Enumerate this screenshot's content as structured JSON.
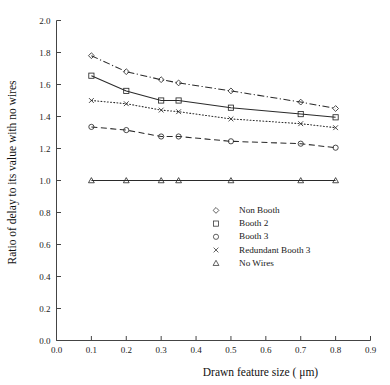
{
  "chart_data": {
    "type": "line",
    "title": "",
    "xlabel": "Drawn feature size ( μm)",
    "ylabel": "Ratio of delay to its value with no wires",
    "xlim": [
      0.0,
      0.9
    ],
    "ylim": [
      0.0,
      2.0
    ],
    "xticks": [
      "0.0",
      "0.1",
      "0.2",
      "0.3",
      "0.4",
      "0.5",
      "0.6",
      "0.7",
      "0.8",
      "0.9"
    ],
    "xtick_values": [
      0.0,
      0.1,
      0.2,
      0.3,
      0.4,
      0.5,
      0.6,
      0.7,
      0.8,
      0.9
    ],
    "yticks": [
      "0.0",
      "0.2",
      "0.4",
      "0.6",
      "0.8",
      "1.0",
      "1.2",
      "1.4",
      "1.6",
      "1.8",
      "2.0"
    ],
    "ytick_values": [
      0.0,
      0.2,
      0.4,
      0.6,
      0.8,
      1.0,
      1.2,
      1.4,
      1.6,
      1.8,
      2.0
    ],
    "grid": false,
    "legend_position": "center",
    "x": [
      0.1,
      0.2,
      0.3,
      0.35,
      0.5,
      0.7,
      0.8
    ],
    "series": [
      {
        "name": "Non Booth",
        "marker": "diamond",
        "linestyle": "dashdot",
        "color": "#2a2a2a",
        "values": [
          1.78,
          1.68,
          1.63,
          1.61,
          1.56,
          1.49,
          1.45
        ]
      },
      {
        "name": "Booth 2",
        "marker": "square",
        "linestyle": "solid",
        "color": "#2a2a2a",
        "values": [
          1.655,
          1.56,
          1.5,
          1.5,
          1.455,
          1.415,
          1.395
        ]
      },
      {
        "name": "Booth 3",
        "marker": "circle",
        "linestyle": "dashed",
        "color": "#2a2a2a",
        "values": [
          1.335,
          1.315,
          1.275,
          1.275,
          1.245,
          1.23,
          1.205
        ]
      },
      {
        "name": "Redundant Booth 3",
        "marker": "cross",
        "linestyle": "dotted",
        "color": "#2a2a2a",
        "values": [
          1.5,
          1.48,
          1.44,
          1.43,
          1.385,
          1.355,
          1.33
        ]
      },
      {
        "name": "No Wires",
        "marker": "triangle",
        "linestyle": "solid",
        "color": "#2a2a2a",
        "values": [
          1.0,
          1.0,
          1.0,
          1.0,
          1.0,
          1.0,
          1.0
        ]
      }
    ]
  },
  "legend": {
    "items": [
      {
        "label": "Non Booth",
        "marker": "diamond-icon"
      },
      {
        "label": "Booth 2",
        "marker": "square-icon"
      },
      {
        "label": "Booth 3",
        "marker": "circle-icon"
      },
      {
        "label": "Redundant Booth 3",
        "marker": "cross-icon"
      },
      {
        "label": "No Wires",
        "marker": "triangle-icon"
      }
    ]
  }
}
